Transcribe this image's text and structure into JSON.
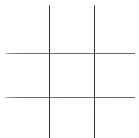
{
  "board": {
    "name": "tic-tac-toe-grid",
    "title": "Tic Tac Toe",
    "background_color": "#ffffff",
    "line_color": "#3a3a3a",
    "horizontal_line_color": "#6a6a6a",
    "rows": 3,
    "columns": 3,
    "cells": [
      {
        "id": "cell-0-0",
        "label": "",
        "row": 0,
        "col": 0
      },
      {
        "id": "cell-0-1",
        "label": "",
        "row": 0,
        "col": 1
      },
      {
        "id": "cell-0-2",
        "label": "",
        "row": 0,
        "col": 2
      },
      {
        "id": "cell-1-0",
        "label": "",
        "row": 1,
        "col": 0
      },
      {
        "id": "cell-1-1",
        "label": "",
        "row": 1,
        "col": 1
      },
      {
        "id": "cell-1-2",
        "label": "",
        "row": 1,
        "col": 2
      },
      {
        "id": "cell-2-0",
        "label": "",
        "row": 2,
        "col": 0
      },
      {
        "id": "cell-2-1",
        "label": "",
        "row": 2,
        "col": 1
      },
      {
        "id": "cell-2-2",
        "label": "",
        "row": 2,
        "col": 2
      }
    ],
    "lines": {
      "vertical": [
        {
          "id": "v-line-1",
          "x": 48.5
        },
        {
          "id": "v-line-2",
          "x": 93.5
        }
      ],
      "horizontal": [
        {
          "id": "h-line-1",
          "y": 52.5
        },
        {
          "id": "h-line-2",
          "y": 96.5
        }
      ]
    }
  }
}
